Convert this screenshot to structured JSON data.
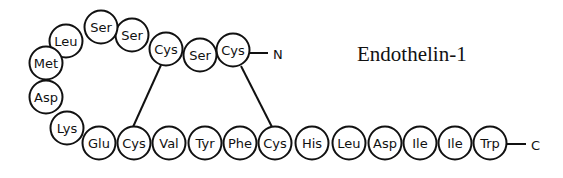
{
  "title": "Endothelin-1",
  "n_terminus": "N",
  "c_terminus": "C",
  "residues": [
    {
      "label": "Cys",
      "x": 233,
      "y": 50
    },
    {
      "label": "Ser",
      "x": 200,
      "y": 55
    },
    {
      "label": "Cys",
      "x": 166,
      "y": 49
    },
    {
      "label": "Ser",
      "x": 132,
      "y": 35
    },
    {
      "label": "Ser",
      "x": 101,
      "y": 27
    },
    {
      "label": "Leu",
      "x": 66,
      "y": 41
    },
    {
      "label": "Met",
      "x": 46,
      "y": 63
    },
    {
      "label": "Asp",
      "x": 46,
      "y": 97
    },
    {
      "label": "Lys",
      "x": 67,
      "y": 128
    },
    {
      "label": "Glu",
      "x": 99,
      "y": 143
    },
    {
      "label": "Cys",
      "x": 134,
      "y": 143
    },
    {
      "label": "Val",
      "x": 169,
      "y": 143
    },
    {
      "label": "Tyr",
      "x": 205,
      "y": 143
    },
    {
      "label": "Phe",
      "x": 240,
      "y": 143
    },
    {
      "label": "Cys",
      "x": 275,
      "y": 143
    },
    {
      "label": "His",
      "x": 312,
      "y": 143
    },
    {
      "label": "Leu",
      "x": 349,
      "y": 143
    },
    {
      "label": "Asp",
      "x": 385,
      "y": 143
    },
    {
      "label": "Ile",
      "x": 420,
      "y": 143
    },
    {
      "label": "Ile",
      "x": 455,
      "y": 143
    },
    {
      "label": "Trp",
      "x": 490,
      "y": 143
    }
  ],
  "disulfide_bonds": [
    {
      "from": "Cys3",
      "to": "Cys11"
    },
    {
      "from": "Cys1",
      "to": "Cys15"
    }
  ]
}
